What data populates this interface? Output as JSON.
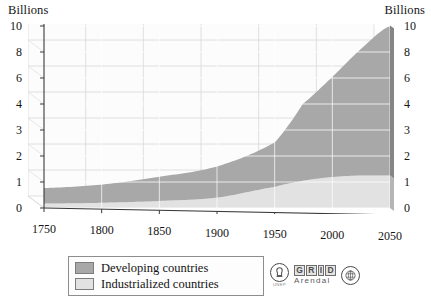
{
  "axes": {
    "unit_label_left": "Billions",
    "unit_label_right": "Billions"
  },
  "legend": {
    "items": [
      {
        "label": "Developing countries",
        "color": "#a8a8a8"
      },
      {
        "label": "Industrialized countries",
        "color": "#e2e2e2"
      }
    ]
  },
  "logo": {
    "unep_label": "UNEP",
    "grid_letters": [
      "G",
      "R",
      "I",
      "D"
    ],
    "grid_subtitle": "Arendal",
    "un_emblem_name": "un-emblem"
  },
  "chart_data": {
    "type": "area",
    "title": "",
    "subtitle": "",
    "xlabel": "",
    "ylabel": "Billions",
    "stacked": true,
    "grid": true,
    "legend_position": "bottom-left",
    "xlim": [
      1750,
      2050
    ],
    "ylim": [
      0,
      10
    ],
    "x_ticks": [
      1750,
      1800,
      1850,
      1900,
      1950,
      2000,
      2050
    ],
    "y_ticks": [
      0,
      1,
      2,
      3,
      4,
      6,
      8,
      10
    ],
    "y_axis_scale": "compressed-upper",
    "x": [
      1750,
      1800,
      1850,
      1900,
      1950,
      1975,
      2000,
      2025,
      2050
    ],
    "series": [
      {
        "name": "Industrialized countries",
        "color": "#e2e2e2",
        "values": [
          0.17,
          0.2,
          0.27,
          0.4,
          0.81,
          1.05,
          1.19,
          1.25,
          1.25
        ]
      },
      {
        "name": "Developing countries",
        "color": "#a8a8a8",
        "values": [
          0.6,
          0.7,
          0.93,
          1.2,
          1.71,
          3.0,
          4.9,
          7.0,
          8.75
        ]
      }
    ],
    "totals": [
      0.77,
      0.9,
      1.2,
      1.6,
      2.52,
      4.05,
      6.09,
      8.25,
      10.0
    ],
    "annotations": []
  }
}
